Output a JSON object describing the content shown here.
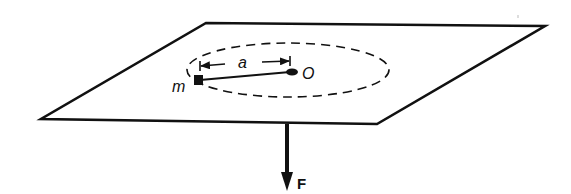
{
  "figure": {
    "labels": {
      "mass": "m",
      "radius": "a",
      "center": "O",
      "force": "F"
    },
    "colors": {
      "ink": "#111111",
      "background": "#ffffff"
    }
  }
}
